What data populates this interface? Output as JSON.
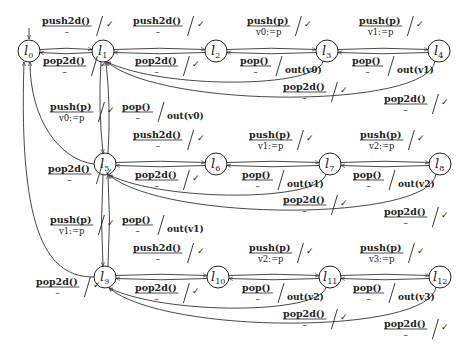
{
  "diagram": {
    "type": "state-machine",
    "initial_state": "l0",
    "states": [
      {
        "id": "l0",
        "label": "l",
        "sub": "0",
        "x": 29,
        "y": 51
      },
      {
        "id": "l1",
        "label": "l",
        "sub": "1",
        "x": 103,
        "y": 51
      },
      {
        "id": "l2",
        "label": "l",
        "sub": "2",
        "x": 216,
        "y": 51
      },
      {
        "id": "l3",
        "label": "l",
        "sub": "3",
        "x": 327,
        "y": 51
      },
      {
        "id": "l4",
        "label": "l",
        "sub": "4",
        "x": 439,
        "y": 51
      },
      {
        "id": "l5",
        "label": "l",
        "sub": "5",
        "x": 105,
        "y": 164
      },
      {
        "id": "l6",
        "label": "l",
        "sub": "6",
        "x": 216,
        "y": 164
      },
      {
        "id": "l7",
        "label": "l",
        "sub": "7",
        "x": 330,
        "y": 164
      },
      {
        "id": "l8",
        "label": "l",
        "sub": "8",
        "x": 440,
        "y": 164
      },
      {
        "id": "l9",
        "label": "l",
        "sub": "9",
        "x": 105,
        "y": 277
      },
      {
        "id": "l10",
        "label": "l",
        "sub": "10",
        "x": 218,
        "y": 277
      },
      {
        "id": "l11",
        "label": "l",
        "sub": "11",
        "x": 330,
        "y": 277
      },
      {
        "id": "l12",
        "label": "l",
        "sub": "12",
        "x": 440,
        "y": 277
      }
    ],
    "labels": [
      {
        "id": "e_l0_l1",
        "from": "l0",
        "to": "l1",
        "action": "push2d()",
        "guard": "–",
        "output": "✓",
        "x": 42,
        "y": 24
      },
      {
        "id": "e_l1_l0",
        "from": "l1",
        "to": "l0",
        "action": "pop2d()",
        "guard": "–",
        "output": "✓",
        "x": 43,
        "y": 64
      },
      {
        "id": "e_l1_l2",
        "from": "l1",
        "to": "l2",
        "action": "push2d()",
        "guard": "–",
        "output": "✓",
        "x": 133,
        "y": 24
      },
      {
        "id": "e_l2_l1",
        "from": "l2",
        "to": "l1",
        "action": "pop2d()",
        "guard": "–",
        "output": "✓",
        "x": 135,
        "y": 64
      },
      {
        "id": "e_l2_l3",
        "from": "l2",
        "to": "l3",
        "action": "push(p)",
        "guard": "v0:=p",
        "output": "✓",
        "x": 247,
        "y": 24
      },
      {
        "id": "e_l3_l2",
        "from": "l3",
        "to": "l2",
        "action": "pop()",
        "guard": "–",
        "output": "out(v0)",
        "x": 240,
        "y": 64
      },
      {
        "id": "e_l3_l4",
        "from": "l3",
        "to": "l4",
        "action": "push(p)",
        "guard": "v1:=p",
        "output": "✓",
        "x": 359,
        "y": 24
      },
      {
        "id": "e_l4_l3",
        "from": "l4",
        "to": "l3",
        "action": "pop()",
        "guard": "–",
        "output": "out(v1)",
        "x": 352,
        "y": 64
      },
      {
        "id": "e_l3_l1",
        "from": "l3",
        "to": "l1",
        "action": "pop2d()",
        "guard": "–",
        "output": "✓",
        "x": 283,
        "y": 90
      },
      {
        "id": "e_l4_l1",
        "from": "l4",
        "to": "l1",
        "action": "pop2d()",
        "guard": "–",
        "output": "✓",
        "x": 384,
        "y": 102
      },
      {
        "id": "e_l1_l5",
        "from": "l1",
        "to": "l5",
        "action": "push(p)",
        "guard": "v0:=p",
        "output": "✓",
        "x": 50,
        "y": 110
      },
      {
        "id": "e_l5_l1",
        "from": "l5",
        "to": "l1",
        "action": "pop()",
        "guard": "–",
        "output": "out(v0)",
        "x": 122,
        "y": 110
      },
      {
        "id": "e_l5_l0",
        "from": "l5",
        "to": "l0",
        "action": "pop2d()",
        "guard": "–",
        "output": "✓",
        "x": 48,
        "y": 172
      },
      {
        "id": "e_l5_l6",
        "from": "l5",
        "to": "l6",
        "action": "push2d()",
        "guard": "–",
        "output": "✓",
        "x": 133,
        "y": 138
      },
      {
        "id": "e_l6_l5",
        "from": "l6",
        "to": "l5",
        "action": "pop2d()",
        "guard": "–",
        "output": "✓",
        "x": 135,
        "y": 178
      },
      {
        "id": "e_l6_l7",
        "from": "l6",
        "to": "l7",
        "action": "push(p)",
        "guard": "v1:=p",
        "output": "✓",
        "x": 249,
        "y": 138
      },
      {
        "id": "e_l7_l6",
        "from": "l7",
        "to": "l6",
        "action": "pop()",
        "guard": "–",
        "output": "out(v1)",
        "x": 242,
        "y": 178
      },
      {
        "id": "e_l7_l8",
        "from": "l7",
        "to": "l8",
        "action": "push(p)",
        "guard": "v2:=p",
        "output": "✓",
        "x": 360,
        "y": 138
      },
      {
        "id": "e_l8_l7",
        "from": "l8",
        "to": "l7",
        "action": "pop()",
        "guard": "–",
        "output": "out(v2)",
        "x": 353,
        "y": 178
      },
      {
        "id": "e_l7_l5",
        "from": "l7",
        "to": "l5",
        "action": "pop2d()",
        "guard": "–",
        "output": "✓",
        "x": 283,
        "y": 203
      },
      {
        "id": "e_l8_l5",
        "from": "l8",
        "to": "l5",
        "action": "pop2d()",
        "guard": "–",
        "output": "✓",
        "x": 384,
        "y": 215
      },
      {
        "id": "e_l5_l9",
        "from": "l5",
        "to": "l9",
        "action": "push(p)",
        "guard": "v1:=p",
        "output": "✓",
        "x": 50,
        "y": 223
      },
      {
        "id": "e_l9_l5",
        "from": "l9",
        "to": "l5",
        "action": "pop()",
        "guard": "–",
        "output": "out(v1)",
        "x": 122,
        "y": 223
      },
      {
        "id": "e_l9_l0",
        "from": "l9",
        "to": "l0",
        "action": "pop2d()",
        "guard": "–",
        "output": "✓",
        "x": 36,
        "y": 285
      },
      {
        "id": "e_l9_l10",
        "from": "l9",
        "to": "l10",
        "action": "push2d()",
        "guard": "–",
        "output": "✓",
        "x": 133,
        "y": 251
      },
      {
        "id": "e_l10_l9",
        "from": "l10",
        "to": "l9",
        "action": "pop2d()",
        "guard": "–",
        "output": "✓",
        "x": 135,
        "y": 291
      },
      {
        "id": "e_l10_l11",
        "from": "l10",
        "to": "l11",
        "action": "push(p)",
        "guard": "v2:=p",
        "output": "✓",
        "x": 249,
        "y": 251
      },
      {
        "id": "e_l11_l10",
        "from": "l11",
        "to": "l10",
        "action": "pop()",
        "guard": "–",
        "output": "out(v2)",
        "x": 242,
        "y": 291
      },
      {
        "id": "e_l11_l12",
        "from": "l11",
        "to": "l12",
        "action": "push(p)",
        "guard": "v3:=p",
        "output": "✓",
        "x": 360,
        "y": 251
      },
      {
        "id": "e_l12_l11",
        "from": "l12",
        "to": "l11",
        "action": "pop()",
        "guard": "–",
        "output": "out(v3)",
        "x": 353,
        "y": 291
      },
      {
        "id": "e_l11_l9",
        "from": "l11",
        "to": "l9",
        "action": "pop2d()",
        "guard": "–",
        "output": "✓",
        "x": 283,
        "y": 317
      },
      {
        "id": "e_l12_l9",
        "from": "l12",
        "to": "l9",
        "action": "pop2d()",
        "guard": "–",
        "output": "✓",
        "x": 384,
        "y": 327
      }
    ]
  }
}
